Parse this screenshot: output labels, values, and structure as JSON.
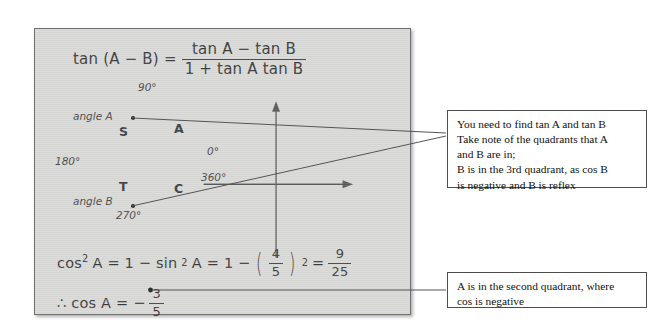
{
  "panel": {
    "equation_top": {
      "lhs": "tan (A − B) =",
      "numerator": "tan A − tan B",
      "denominator": "1 + tan A tan B"
    },
    "equation_bottom_1": {
      "part1": "cos",
      "part1_exp": "2",
      "part1_var": "A = 1 − sin",
      "part2_exp": "2",
      "part2_var": "A = 1 −",
      "inner_num": "4",
      "inner_den": "5",
      "inner_exp": "2",
      "equals": "=",
      "result_num": "9",
      "result_den": "25"
    },
    "equation_bottom_2": {
      "lhs": "∴ cos A = −",
      "num": "3",
      "den": "5"
    }
  },
  "diagram": {
    "name": "cast-quadrant-diagram",
    "axis_labels": {
      "top": "90°",
      "left": "180°",
      "right_top": "0°",
      "right_bottom": "360°",
      "bottom": "270°"
    },
    "quadrants": {
      "top_left": "S",
      "top_right": "A",
      "bottom_left": "T",
      "bottom_right": "C"
    },
    "markers": {
      "angle_a": "angle A",
      "angle_b": "angle B"
    }
  },
  "notes": [
    {
      "id": "note-quadrants",
      "lines": [
        "You need to find tan A and tan B",
        "Take note of the quadrants that A",
        "and B are in;",
        "B is in the 3rd quadrant, as cos B",
        "is negative and B is reflex"
      ]
    },
    {
      "id": "note-cos-a",
      "lines": [
        "A is in the second quadrant, where",
        "cos is negative"
      ]
    }
  ],
  "colors": {
    "panel_fill": "#d8d8d6",
    "panel_border": "#6e6e6e",
    "ink": "#3b3b3b",
    "note_border": "#4d4d4d",
    "connector": "#555555"
  }
}
